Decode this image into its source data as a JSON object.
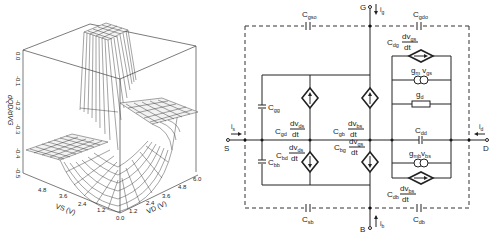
{
  "plot3d": {
    "z_axis_label": "dQD/dVG",
    "z_ticks": [
      "0.0",
      "-0.1",
      "-0.2",
      "-0.3",
      "-0.4",
      "-0.5"
    ],
    "x_axis_label": "VS (V)",
    "x_ticks": [
      "4.8",
      "3.6",
      "2.4",
      "1.2",
      "0.0"
    ],
    "y_axis_label": "VD (V)",
    "y_ticks": [
      "1.2",
      "2.4",
      "3.6",
      "4.8",
      "6.0"
    ]
  },
  "circuit": {
    "terminals": {
      "gate": "G",
      "source": "S",
      "drain": "D",
      "bulk": "B"
    },
    "currents": {
      "gate": {
        "base": "i",
        "sub": "g"
      },
      "source": {
        "base": "i",
        "sub": "s"
      },
      "drain": {
        "base": "i",
        "sub": "d"
      },
      "bulk": {
        "base": "i",
        "sub": "b"
      }
    },
    "capacitors": {
      "cgso": {
        "base": "C",
        "sub": "gso"
      },
      "cgdo": {
        "base": "C",
        "sub": "gdo"
      },
      "csb": {
        "base": "C",
        "sub": "sb"
      },
      "cdb": {
        "base": "C",
        "sub": "db"
      },
      "cgg": {
        "base": "C",
        "sub": "gg"
      },
      "cbb": {
        "base": "C",
        "sub": "bb"
      },
      "cdd": {
        "base": "C",
        "sub": "dd"
      }
    },
    "dependent_sources": {
      "cgd": {
        "coef": "C",
        "coef_sub": "gd",
        "num": "dv",
        "num_sub": "ds",
        "den": "dt"
      },
      "cgb": {
        "coef": "C",
        "coef_sub": "gb",
        "num": "dv",
        "num_sub": "bs",
        "den": "dt"
      },
      "cbd": {
        "coef": "C",
        "coef_sub": "bd",
        "num": "dv",
        "num_sub": "ds",
        "den": "dt"
      },
      "cbg": {
        "coef": "C",
        "coef_sub": "bg",
        "num": "dv",
        "num_sub": "gs",
        "den": "dt"
      },
      "cdg": {
        "coef": "C",
        "coef_sub": "dg",
        "num": "dv",
        "num_sub": "gs",
        "den": "dt"
      },
      "cdb": {
        "coef": "C",
        "coef_sub": "db",
        "num": "dv",
        "num_sub": "bs",
        "den": "dt"
      }
    },
    "transconductances": {
      "gm": {
        "base": "g",
        "sub": "m",
        "v": "v",
        "v_sub": "gs"
      },
      "gmb": {
        "base": "g",
        "sub": "mb",
        "v": "v",
        "v_sub": "bs"
      }
    },
    "conductance": {
      "base": "g",
      "sub": "d"
    }
  }
}
